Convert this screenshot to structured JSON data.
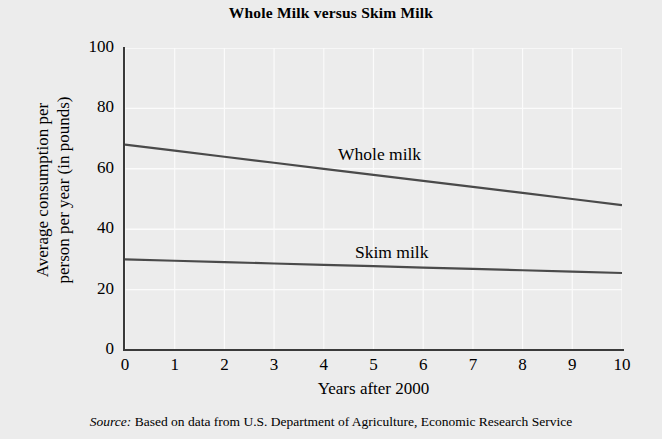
{
  "chart_data": {
    "type": "line",
    "title": "Whole Milk versus Skim Milk",
    "xlabel": "Years after 2000",
    "ylabel": "Average consumption per person per year (in pounds)",
    "ylabel_line1": "Average consumption per",
    "ylabel_line2": "person per year (in pounds)",
    "xlim": [
      0,
      10
    ],
    "ylim": [
      0,
      100
    ],
    "xticks": [
      0,
      1,
      2,
      3,
      4,
      5,
      6,
      7,
      8,
      9,
      10
    ],
    "yticks": [
      0,
      20,
      40,
      60,
      80,
      100
    ],
    "xtick_labels": [
      "0",
      "1",
      "2",
      "3",
      "4",
      "5",
      "6",
      "7",
      "8",
      "9",
      "10"
    ],
    "ytick_labels": [
      "0",
      "20",
      "40",
      "60",
      "80",
      "100"
    ],
    "grid": true,
    "grid_color": "#fbfbfb",
    "background_color": "#ececec",
    "line_color": "#4a4a4a",
    "axis_color": "#3a3a3a",
    "legend_position": "inline-labels",
    "x": [
      0,
      1,
      2,
      3,
      4,
      5,
      6,
      7,
      8,
      9,
      10
    ],
    "series": [
      {
        "name": "Whole milk",
        "label": "Whole milk",
        "values": [
          68,
          66,
          64,
          62,
          60,
          58,
          56,
          54,
          52,
          50,
          48
        ]
      },
      {
        "name": "Skim milk",
        "label": "Skim milk",
        "values": [
          30,
          29.55,
          29.1,
          28.65,
          28.2,
          27.75,
          27.3,
          26.85,
          26.4,
          25.95,
          25.5
        ]
      }
    ],
    "annotations": [
      {
        "text": "Whole milk",
        "x": 4.3,
        "y": 64
      },
      {
        "text": "Skim milk",
        "x": 4.6,
        "y": 33
      }
    ]
  },
  "source": {
    "prefix": "Source:",
    "text": " Based on data from U.S. Department of Agriculture, Economic Research Service"
  }
}
